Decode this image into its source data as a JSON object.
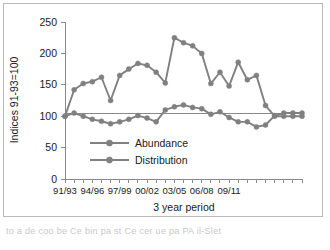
{
  "chart_data": {
    "type": "line",
    "title": "",
    "xlabel": "3 year period",
    "ylabel": "Indices 91-93=100",
    "ylim": [
      0,
      250
    ],
    "ytick_labels": [
      "0",
      "50",
      "100",
      "150",
      "200",
      "250"
    ],
    "ytick_values": [
      0,
      50,
      100,
      150,
      200,
      250
    ],
    "xtick_labels": [
      "91/93",
      "94/96",
      "97/99",
      "00/02",
      "03/05",
      "06/08",
      "09/11"
    ],
    "xtick_positions": [
      0,
      3,
      6,
      9,
      12,
      15,
      18
    ],
    "grid": false,
    "legend_position": "center-left-inside",
    "reference_line": 105,
    "n_points": 27,
    "x_index": [
      0,
      1,
      2,
      3,
      4,
      5,
      6,
      7,
      8,
      9,
      10,
      11,
      12,
      13,
      14,
      15,
      16,
      17,
      18,
      19,
      20,
      21,
      22,
      23,
      24,
      25,
      26
    ],
    "series": [
      {
        "name": "Abundance",
        "color": "#808080",
        "marker": "circle",
        "values": [
          100,
          142,
          152,
          155,
          162,
          125,
          165,
          175,
          184,
          181,
          170,
          153,
          225,
          217,
          212,
          200,
          152,
          170,
          148,
          186,
          158,
          165,
          117,
          100,
          100,
          100,
          100
        ]
      },
      {
        "name": "Distribution",
        "color": "#808080",
        "marker": "circle",
        "values": [
          100,
          105,
          100,
          95,
          92,
          88,
          91,
          95,
          101,
          97,
          91,
          110,
          115,
          118,
          114,
          112,
          103,
          107,
          98,
          91,
          91,
          83,
          86,
          101,
          105,
          105,
          105
        ]
      }
    ],
    "legend_entries": [
      "Abundance",
      "Distribution"
    ]
  },
  "caption": {
    "text": "to a de coo be Ce bin pa st Ce cer ue pa PA il-Slet"
  },
  "colors": {
    "series": "#808080",
    "axis": "#8a8a8a",
    "frame": "#b9b9b9",
    "text": "#1a1a1a",
    "background": "#ffffff"
  }
}
